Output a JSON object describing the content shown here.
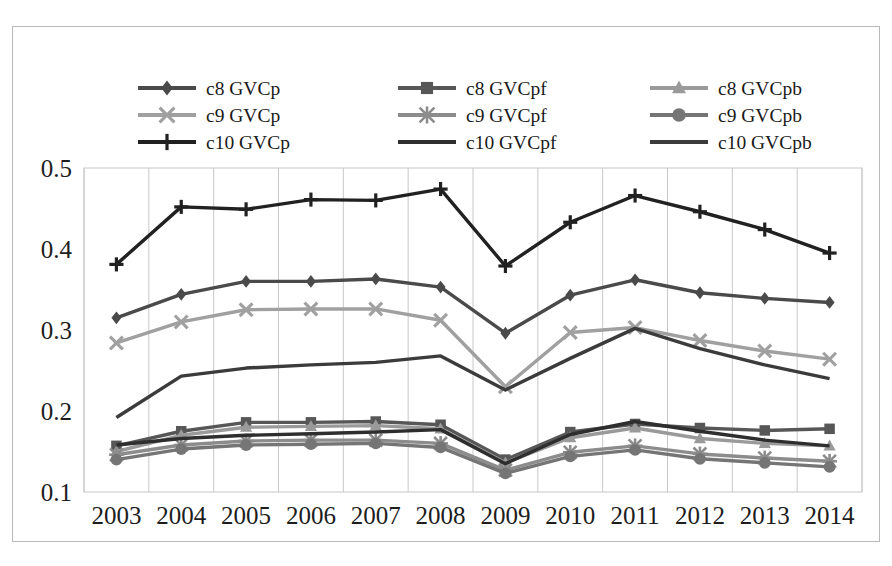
{
  "chart_data": {
    "type": "line",
    "title": "",
    "subtitle": "",
    "xlabel": "",
    "ylabel": "",
    "categories": [
      "2003",
      "2004",
      "2005",
      "2006",
      "2007",
      "2008",
      "2009",
      "2010",
      "2011",
      "2012",
      "2013",
      "2014"
    ],
    "x": [
      2003,
      2004,
      2005,
      2006,
      2007,
      2008,
      2009,
      2010,
      2011,
      2012,
      2013,
      2014
    ],
    "ylim": [
      0.1,
      0.5
    ],
    "yticks": [
      0.1,
      0.2,
      0.3,
      0.4,
      0.5
    ],
    "ytick_labels": [
      "0.1",
      "0.2",
      "0.3",
      "0.4",
      "0.5"
    ],
    "xtick_labels": [
      "2003",
      "2004",
      "2005",
      "2006",
      "2007",
      "2008",
      "2009",
      "2010",
      "2011",
      "2012",
      "2013",
      "2014"
    ],
    "grid": {
      "vertical": true,
      "horizontal": false
    },
    "legend_position": "top",
    "legend_columns": 3,
    "series": [
      {
        "name": "c8 GVCp",
        "marker": "diamond",
        "color": "#4a4a4a",
        "values": [
          0.315,
          0.344,
          0.36,
          0.36,
          0.363,
          0.353,
          0.296,
          0.343,
          0.362,
          0.346,
          0.339,
          0.334
        ]
      },
      {
        "name": "c8 GVCpf",
        "marker": "square",
        "color": "#575757",
        "values": [
          0.157,
          0.175,
          0.186,
          0.186,
          0.187,
          0.183,
          0.14,
          0.174,
          0.184,
          0.179,
          0.176,
          0.178
        ]
      },
      {
        "name": "c8 GVCpb",
        "marker": "triangle",
        "color": "#9a9a9a",
        "values": [
          0.15,
          0.17,
          0.18,
          0.181,
          0.182,
          0.178,
          0.136,
          0.167,
          0.179,
          0.166,
          0.16,
          0.157
        ]
      },
      {
        "name": "c9 GVCp",
        "marker": "x",
        "color": "#a0a0a0",
        "values": [
          0.284,
          0.31,
          0.325,
          0.326,
          0.326,
          0.312,
          0.23,
          0.297,
          0.303,
          0.287,
          0.274,
          0.264
        ]
      },
      {
        "name": "c9 GVCpf",
        "marker": "star",
        "color": "#8c8c8c",
        "values": [
          0.146,
          0.158,
          0.163,
          0.164,
          0.164,
          0.16,
          0.127,
          0.149,
          0.157,
          0.147,
          0.142,
          0.138
        ]
      },
      {
        "name": "c9 GVCpb",
        "marker": "circle",
        "color": "#757575",
        "values": [
          0.14,
          0.153,
          0.158,
          0.159,
          0.16,
          0.155,
          0.123,
          0.144,
          0.152,
          0.141,
          0.136,
          0.131
        ]
      },
      {
        "name": "c10 GVCp",
        "marker": "plus",
        "color": "#212121",
        "values": [
          0.381,
          0.452,
          0.449,
          0.461,
          0.46,
          0.474,
          0.379,
          0.433,
          0.466,
          0.446,
          0.424,
          0.395
        ]
      },
      {
        "name": "c10 GVCpf",
        "marker": "none",
        "color": "#2e2e2e",
        "values": [
          0.158,
          0.166,
          0.17,
          0.172,
          0.174,
          0.177,
          0.135,
          0.171,
          0.187,
          0.175,
          0.164,
          0.157
        ]
      },
      {
        "name": "c10 GVCpb",
        "marker": "none",
        "color": "#3b3b3b",
        "values": [
          0.192,
          0.243,
          0.253,
          0.257,
          0.26,
          0.268,
          0.226,
          0.265,
          0.302,
          0.277,
          0.257,
          0.24
        ]
      }
    ]
  },
  "legend": {
    "items": [
      {
        "label": "c8 GVCp"
      },
      {
        "label": "c8 GVCpf"
      },
      {
        "label": "c8 GVCpb"
      },
      {
        "label": "c9 GVCp"
      },
      {
        "label": "c9 GVCpf"
      },
      {
        "label": "c9 GVCpb"
      },
      {
        "label": "c10 GVCp"
      },
      {
        "label": "c10 GVCpf"
      },
      {
        "label": "c10 GVCpb"
      }
    ]
  },
  "colors": {
    "frame": "#b9b9b9",
    "gridline": "#c8c8c8",
    "axis_text": "#1d1d1d",
    "background": "#ffffff"
  }
}
